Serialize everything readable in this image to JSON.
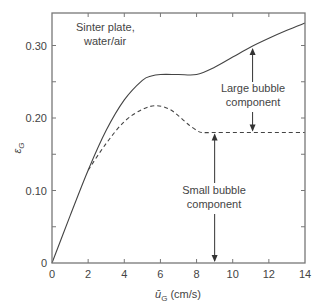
{
  "chart_data": {
    "type": "line",
    "title": "",
    "xlabel": "ū_G (cm/s)",
    "ylabel": "ε_G",
    "xlim": [
      0,
      14
    ],
    "ylim": [
      0,
      0.345
    ],
    "x_ticks": [
      "0",
      "2",
      "4",
      "6",
      "8",
      "10",
      "12",
      "14"
    ],
    "y_ticks": [
      "0",
      "0.10",
      "0.20",
      "0.30"
    ],
    "grid": false,
    "legend": null,
    "series": [
      {
        "name": "Total gas holdup",
        "style": "solid",
        "x": [
          0,
          1,
          2,
          3,
          4,
          5,
          5.5,
          6,
          7,
          8,
          9,
          10,
          11,
          12,
          13,
          14
        ],
        "y": [
          0,
          0.065,
          0.128,
          0.183,
          0.225,
          0.252,
          0.258,
          0.26,
          0.26,
          0.26,
          0.27,
          0.284,
          0.298,
          0.31,
          0.321,
          0.331
        ]
      },
      {
        "name": "Small bubble holdup",
        "style": "dashed",
        "x": [
          2,
          3,
          4,
          5,
          5.8,
          6.5,
          7,
          7.5,
          8,
          8.3,
          9,
          10,
          11,
          12,
          13,
          14
        ],
        "y": [
          0.128,
          0.165,
          0.195,
          0.212,
          0.217,
          0.212,
          0.203,
          0.192,
          0.183,
          0.18,
          0.18,
          0.18,
          0.18,
          0.18,
          0.18,
          0.18
        ]
      }
    ],
    "annotations": [
      {
        "text": "Sinter plate,\nwater/air",
        "x": 2.2,
        "y": 0.325
      },
      {
        "text": "Large bubble\ncomponent",
        "x": 11.1,
        "y": 0.225,
        "arrow_range": [
          0.18,
          0.298
        ]
      },
      {
        "text": "Small bubble\ncomponent",
        "x": 9.0,
        "y": 0.09,
        "arrow_range": [
          0,
          0.18
        ]
      }
    ]
  },
  "labels": {
    "annot_sinter_1": "Sinter plate,",
    "annot_sinter_2": "water/air",
    "annot_large_1": "Large bubble",
    "annot_large_2": "component",
    "annot_small_1": "Small bubble",
    "annot_small_2": "component",
    "ylabel_main": "ε",
    "ylabel_sub": "G",
    "xlabel_main": "ū",
    "xlabel_sub": "G",
    "xlabel_unit": " (cm/s)"
  }
}
